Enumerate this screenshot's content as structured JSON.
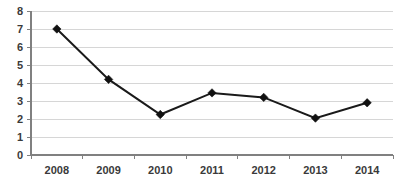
{
  "chart_data": {
    "type": "line",
    "title": "",
    "subtitle": "",
    "xlabel": "",
    "ylabel": "",
    "categories": [
      "2008",
      "2009",
      "2010",
      "2011",
      "2012",
      "2013",
      "2014"
    ],
    "values": [
      7.0,
      4.2,
      2.25,
      3.45,
      3.2,
      2.05,
      2.9
    ],
    "series": [
      {
        "name": "",
        "values": [
          7.0,
          4.2,
          2.25,
          3.45,
          3.2,
          2.05,
          2.9
        ]
      }
    ],
    "ylim": [
      0,
      8
    ],
    "ytick_labels": [
      "0",
      "1",
      "2",
      "3",
      "4",
      "5",
      "6",
      "7",
      "8"
    ],
    "ytick_values": [
      0,
      1,
      2,
      3,
      4,
      5,
      6,
      7,
      8
    ],
    "xtick_labels": [
      "2008",
      "2009",
      "2010",
      "2011",
      "2012",
      "2013",
      "2014"
    ],
    "grid": "horizontal",
    "legend": "none",
    "marker": "diamond",
    "colors": {
      "line": "#1a1a1a",
      "marker": "#111111",
      "grid": "#d6d6d6",
      "axis": "#808080",
      "text": "#3a3a3a",
      "background": "#ffffff"
    }
  }
}
